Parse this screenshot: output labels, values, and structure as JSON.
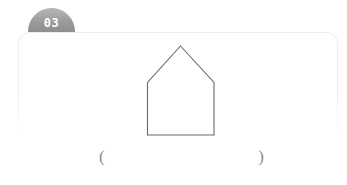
{
  "page": {
    "background_color": "#ffffff",
    "width": 347,
    "height": 185
  },
  "badge": {
    "number": "03",
    "shape": "dome-semicircle",
    "fill_color": "#9a9a9a",
    "text_color": "#ffffff"
  },
  "panel": {
    "border_color": "#eceef0",
    "shape": "rounded-rectangle"
  },
  "figure": {
    "name": "pentagon-house-outline",
    "shape_type": "pentagon",
    "stroke_color": "#6b6b6b",
    "fill_color": "none",
    "vertices": [
      [
        35,
        4
      ],
      [
        69,
        40
      ],
      [
        69,
        93
      ],
      [
        2,
        93
      ],
      [
        2,
        40
      ]
    ],
    "label": ""
  },
  "answer": {
    "open_paren": "(",
    "close_paren": ")",
    "value": "",
    "placeholder": ""
  },
  "watermark": {
    "text": ""
  }
}
